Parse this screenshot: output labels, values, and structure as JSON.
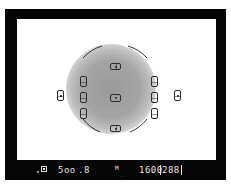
{
  "viewfinder": {
    "frame_color": "#050505",
    "screen_color": "#ffffff",
    "metering_circle_color": "#9a9a9a",
    "af_points": [
      {
        "id": "top",
        "orientation": "horizontal"
      },
      {
        "id": "center",
        "orientation": "center"
      },
      {
        "id": "bottom",
        "orientation": "horizontal"
      },
      {
        "id": "left-upper",
        "orientation": "vertical"
      },
      {
        "id": "left-middle",
        "orientation": "vertical"
      },
      {
        "id": "left-lower",
        "orientation": "vertical"
      },
      {
        "id": "right-upper",
        "orientation": "vertical"
      },
      {
        "id": "right-middle",
        "orientation": "vertical"
      },
      {
        "id": "right-lower",
        "orientation": "vertical"
      },
      {
        "id": "far-left",
        "orientation": "vertical"
      },
      {
        "id": "far-right",
        "orientation": "vertical"
      }
    ]
  },
  "status_bar": {
    "indicator_dot": "•",
    "shutter_speed": "5oo",
    "aperture": ".8",
    "mode": "M",
    "mode_sub": "..",
    "iso": "1600",
    "shots_remaining": "288"
  }
}
